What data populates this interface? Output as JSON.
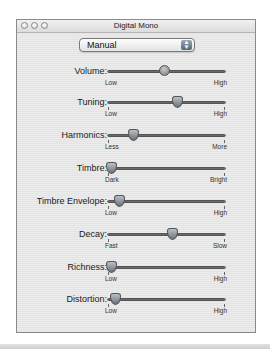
{
  "window": {
    "title": "Digital Mono",
    "traffic_lights": [
      "close",
      "minimize",
      "zoom"
    ]
  },
  "preset_popup": {
    "selected": "Manual",
    "icon": "updown-arrows-icon"
  },
  "sliders": [
    {
      "label": "Volume:",
      "min_label": "Low",
      "max_label": "High",
      "value_pct": 48,
      "knob": "round",
      "ticks": false
    },
    {
      "label": "Tuning:",
      "min_label": "Low",
      "max_label": "High",
      "value_pct": 59,
      "knob": "pointer",
      "ticks": true
    },
    {
      "label": "Harmonics:",
      "min_label": "Less",
      "max_label": "More",
      "value_pct": 22,
      "knob": "pointer",
      "ticks": true
    },
    {
      "label": "Timbre:",
      "min_label": "Dark",
      "max_label": "Bright",
      "value_pct": 3,
      "knob": "pointer",
      "ticks": true
    },
    {
      "label": "Timbre Envelope:",
      "min_label": "Low",
      "max_label": "High",
      "value_pct": 10,
      "knob": "pointer",
      "ticks": true
    },
    {
      "label": "Decay:",
      "min_label": "Fast",
      "max_label": "Slow",
      "value_pct": 55,
      "knob": "pointer",
      "ticks": true
    },
    {
      "label": "Richness:",
      "min_label": "Low",
      "max_label": "High",
      "value_pct": 3,
      "knob": "pointer",
      "ticks": true
    },
    {
      "label": "Distortion:",
      "min_label": "Low",
      "max_label": "High",
      "value_pct": 6,
      "knob": "pointer",
      "ticks": true
    }
  ]
}
